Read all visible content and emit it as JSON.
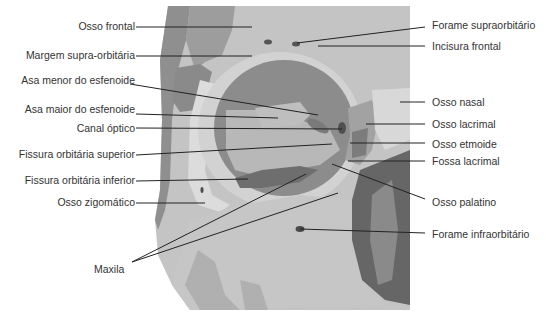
{
  "diagram": {
    "colors": {
      "background": "#ffffff",
      "bone_light": "#c9c9c9",
      "bone_mid": "#b3b3b3",
      "bone_dark": "#8e8e8e",
      "orbit_cavity": "#9a9a9a",
      "nasal_cavity": "#5e5e5e",
      "leader_line": "#222222",
      "label_text": "#333333"
    },
    "labels_left": [
      {
        "id": "osso-frontal",
        "text": "Osso frontal"
      },
      {
        "id": "margem-supra-orbitaria",
        "text": "Margem supra-orbitária"
      },
      {
        "id": "asa-menor-esfenoide",
        "text": "Asa menor do esfenoide"
      },
      {
        "id": "asa-maior-esfenoide",
        "text": "Asa maior do esfenoide"
      },
      {
        "id": "canal-optico",
        "text": "Canal óptico"
      },
      {
        "id": "fissura-orbitaria-superior",
        "text": "Fissura orbitária superior"
      },
      {
        "id": "fissura-orbitaria-inferior",
        "text": "Fissura orbitária inferior"
      },
      {
        "id": "osso-zigomatico",
        "text": "Osso zigomático"
      },
      {
        "id": "maxila",
        "text": "Maxila"
      }
    ],
    "labels_right": [
      {
        "id": "forame-supraorbitario",
        "text": "Forame supraorbitário"
      },
      {
        "id": "incisura-frontal",
        "text": "Incisura frontal"
      },
      {
        "id": "osso-nasal",
        "text": "Osso nasal"
      },
      {
        "id": "osso-lacrimal",
        "text": "Osso lacrimal"
      },
      {
        "id": "osso-etmoide",
        "text": "Osso etmoide"
      },
      {
        "id": "fossa-lacrimal",
        "text": "Fossa lacrimal"
      },
      {
        "id": "osso-palatino",
        "text": "Osso palatino"
      },
      {
        "id": "forame-infraorbitario",
        "text": "Forame infraorbitário"
      }
    ]
  }
}
